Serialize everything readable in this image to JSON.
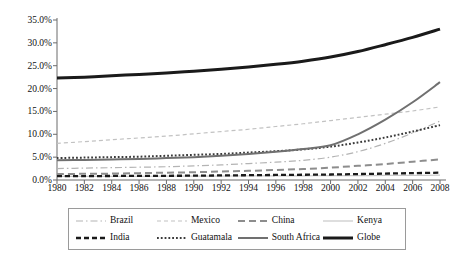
{
  "chart_data": {
    "type": "line",
    "title": "",
    "subtitle": "",
    "xlabel": "",
    "ylabel": "",
    "xlim": [
      1980,
      2008
    ],
    "ylim": [
      0,
      35
    ],
    "grid": false,
    "legend_position": "bottom",
    "x": [
      1980,
      1982,
      1984,
      1986,
      1988,
      1990,
      1992,
      1994,
      1996,
      1998,
      2000,
      2002,
      2004,
      2006,
      2008
    ],
    "xtick_labels": [
      "1980",
      "1982",
      "1984",
      "1986",
      "1988",
      "1990",
      "1992",
      "1994",
      "1996",
      "1998",
      "2000",
      "2002",
      "2004",
      "2006",
      "2008"
    ],
    "ytick_values": [
      0,
      5,
      10,
      15,
      20,
      25,
      30,
      35
    ],
    "ytick_labels": [
      "0.0%",
      "5.0%",
      "10.0%",
      "15.0%",
      "20.0%",
      "25.0%",
      "30.0%",
      "35.0%"
    ],
    "series": [
      {
        "name": "Brazil",
        "style": "dashdot",
        "color": "#b4b4b4",
        "width": 1.2,
        "values": [
          2.5,
          2.6,
          2.7,
          2.8,
          2.9,
          3.1,
          3.3,
          3.6,
          3.9,
          4.3,
          5.0,
          6.2,
          8.0,
          10.3,
          12.9
        ]
      },
      {
        "name": "Mexico",
        "style": "dashed",
        "color": "#c2c2c2",
        "width": 1.2,
        "values": [
          8.0,
          8.4,
          8.8,
          9.2,
          9.6,
          10.1,
          10.6,
          11.1,
          11.7,
          12.3,
          13.0,
          13.7,
          14.4,
          15.1,
          16.0
        ]
      },
      {
        "name": "China",
        "style": "dashed-long",
        "color": "#8d8d8d",
        "width": 2.0,
        "values": [
          1.3,
          1.35,
          1.4,
          1.5,
          1.6,
          1.7,
          1.85,
          2.0,
          2.2,
          2.4,
          2.7,
          3.1,
          3.5,
          4.0,
          4.5
        ]
      },
      {
        "name": "Kenya",
        "style": "solid",
        "color": "#c8c8c8",
        "width": 1.2,
        "values": [
          0.8,
          0.8,
          0.8,
          0.8,
          0.85,
          0.85,
          0.85,
          0.9,
          0.9,
          0.9,
          0.95,
          0.95,
          1.0,
          1.0,
          1.05
        ]
      },
      {
        "name": "India",
        "style": "dashed-thick",
        "color": "#1a1a1a",
        "width": 2.3,
        "values": [
          0.85,
          0.85,
          0.88,
          0.9,
          0.92,
          0.95,
          1.0,
          1.05,
          1.1,
          1.15,
          1.2,
          1.3,
          1.4,
          1.5,
          1.6
        ]
      },
      {
        "name": "Guatamala",
        "style": "dotted",
        "color": "#3a3a3a",
        "width": 2.0,
        "values": [
          4.8,
          4.9,
          5.0,
          5.1,
          5.3,
          5.5,
          5.7,
          6.0,
          6.3,
          6.7,
          7.3,
          8.2,
          9.3,
          10.6,
          12.0
        ]
      },
      {
        "name": "South Africa",
        "style": "solid",
        "color": "#707070",
        "width": 2.0,
        "values": [
          4.3,
          4.4,
          4.5,
          4.6,
          4.8,
          5.0,
          5.3,
          5.7,
          6.2,
          6.8,
          7.6,
          10.0,
          13.2,
          17.0,
          21.4
        ]
      },
      {
        "name": "Globe",
        "style": "solid",
        "color": "#1a1a1a",
        "width": 3.0,
        "values": [
          22.3,
          22.5,
          22.8,
          23.1,
          23.4,
          23.8,
          24.2,
          24.7,
          25.3,
          26.0,
          26.9,
          28.1,
          29.6,
          31.2,
          33.0
        ]
      }
    ]
  }
}
